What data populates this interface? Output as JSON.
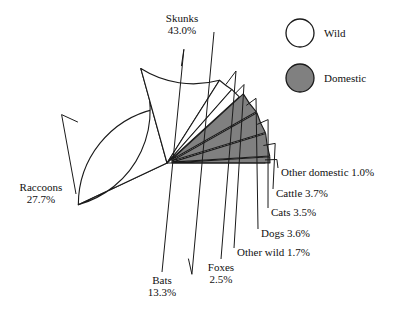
{
  "chart_data": {
    "type": "pie",
    "title": "",
    "subtitle": "",
    "xlabel": "",
    "ylabel": "",
    "grid": false,
    "legend_position": "top-right",
    "units": "percent",
    "start_angle_deg": 0,
    "direction": "counterclockwise",
    "categories": [
      "Skunks",
      "Raccoons",
      "Bats",
      "Foxes",
      "Other wild",
      "Dogs",
      "Cats",
      "Cattle",
      "Other domestic"
    ],
    "values": [
      43.0,
      27.7,
      13.3,
      2.5,
      1.7,
      3.6,
      3.5,
      3.7,
      1.0
    ],
    "slices": [
      {
        "label": "Skunks",
        "value": 43.0,
        "value_text": "43.0%",
        "group": "Wild",
        "color": "#ffffff",
        "exploded": false
      },
      {
        "label": "Raccoons",
        "value": 27.7,
        "value_text": "27.7%",
        "group": "Wild",
        "color": "#ffffff",
        "exploded": false
      },
      {
        "label": "Bats",
        "value": 13.3,
        "value_text": "13.3%",
        "group": "Wild",
        "color": "#ffffff",
        "exploded": false
      },
      {
        "label": "Foxes",
        "value": 2.5,
        "value_text": "2.5%",
        "group": "Wild",
        "color": "#ffffff",
        "exploded": false
      },
      {
        "label": "Other wild",
        "value": 1.7,
        "value_text": "1.7%",
        "group": "Wild",
        "color": "#ffffff",
        "exploded": false
      },
      {
        "label": "Dogs",
        "value": 3.6,
        "value_text": "3.6%",
        "group": "Domestic",
        "color": "#808080",
        "exploded": true
      },
      {
        "label": "Cats",
        "value": 3.5,
        "value_text": "3.5%",
        "group": "Domestic",
        "color": "#808080",
        "exploded": true
      },
      {
        "label": "Cattle",
        "value": 3.7,
        "value_text": "3.7%",
        "group": "Domestic",
        "color": "#808080",
        "exploded": true
      },
      {
        "label": "Other domestic",
        "value": 1.0,
        "value_text": "1.0%",
        "group": "Domestic",
        "color": "#808080",
        "exploded": true
      }
    ],
    "legend": [
      {
        "label": "Wild",
        "color": "#ffffff"
      },
      {
        "label": "Domestic",
        "color": "#808080"
      }
    ]
  },
  "labels": {
    "skunks_name": "Skunks",
    "skunks_value": "43.0%",
    "raccoons_name": "Raccoons",
    "raccoons_value": "27.7%",
    "bats_name": "Bats",
    "bats_value": "13.3%",
    "foxes_name": "Foxes",
    "foxes_value": "2.5%",
    "other_wild": "Other wild 1.7%",
    "dogs": "Dogs 3.6%",
    "cats": "Cats 3.5%",
    "cattle": "Cattle 3.7%",
    "other_domestic": "Other domestic 1.0%"
  },
  "legend": {
    "wild_label": "Wild",
    "domestic_label": "Domestic"
  },
  "colors": {
    "wild_fill": "#ffffff",
    "domestic_fill": "#808080",
    "stroke": "#1a1a1a",
    "background": "#ffffff"
  }
}
